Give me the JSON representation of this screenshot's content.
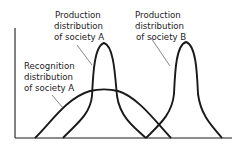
{
  "diagram": {
    "type": "distribution-curves",
    "labels": {
      "production_a": [
        "Production",
        "distribution",
        "of society A"
      ],
      "production_b": [
        "Production",
        "distribution",
        "of society B"
      ],
      "recognition_a": [
        "Recognition",
        "distribution",
        "of society A"
      ]
    },
    "curves": [
      {
        "name": "recognition-distribution-society-a",
        "shape": "wide bell",
        "relative_center": 0.42,
        "relative_peak": 0.45
      },
      {
        "name": "production-distribution-society-a",
        "shape": "narrow bell",
        "relative_center": 0.42,
        "relative_peak": 0.88
      },
      {
        "name": "production-distribution-society-b",
        "shape": "narrow bell",
        "relative_center": 0.79,
        "relative_peak": 0.89
      }
    ],
    "axes": {
      "x_label": "",
      "y_label": ""
    },
    "colors": {
      "line": "#1a1a1a",
      "background": "#ffffff"
    }
  }
}
